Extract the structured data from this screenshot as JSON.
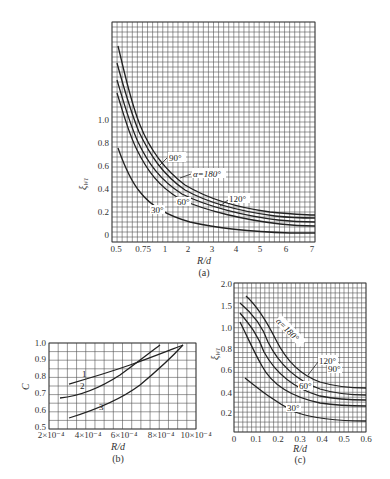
{
  "chart_data": [
    {
      "id": "a",
      "type": "line",
      "caption": "(a)",
      "xlabel": "R/d",
      "ylabel": "ξW1",
      "x_ticks": [
        "0.5",
        "0.75",
        "1",
        "2",
        "3",
        "4",
        "5",
        "6",
        "7"
      ],
      "y_ticks": [
        "0",
        "0.2",
        "0.4",
        "0.6",
        "0.8",
        "1.0"
      ],
      "ylim": [
        0,
        1.85
      ],
      "grid": true,
      "series": [
        {
          "name": "α=180°",
          "x": [
            0.55,
            0.75,
            1,
            2,
            3,
            4,
            5,
            6,
            7
          ],
          "values": [
            1.5,
            1.05,
            0.72,
            0.46,
            0.36,
            0.31,
            0.29,
            0.27,
            0.26
          ]
        },
        {
          "name": "120°",
          "x": [
            0.55,
            0.75,
            1,
            2,
            3,
            4,
            5,
            6,
            7
          ],
          "values": [
            1.33,
            0.92,
            0.62,
            0.39,
            0.3,
            0.26,
            0.24,
            0.22,
            0.21
          ]
        },
        {
          "name": "90°",
          "x": [
            0.55,
            0.75,
            1,
            2,
            3,
            4,
            5,
            6,
            7
          ],
          "values": [
            1.76,
            1.15,
            0.8,
            0.52,
            0.4,
            0.35,
            0.32,
            0.3,
            0.29
          ]
        },
        {
          "name": "60°",
          "x": [
            0.55,
            0.75,
            1,
            2,
            3,
            4,
            5,
            6,
            7
          ],
          "values": [
            1.24,
            0.84,
            0.55,
            0.33,
            0.25,
            0.21,
            0.19,
            0.18,
            0.17
          ]
        },
        {
          "name": "30°",
          "x": [
            0.55,
            0.75,
            1,
            2,
            3,
            4,
            5,
            6,
            7
          ],
          "values": [
            0.77,
            0.5,
            0.32,
            0.18,
            0.13,
            0.1,
            0.09,
            0.08,
            0.08
          ]
        }
      ],
      "annotations": [
        "90°",
        "α=180°",
        "120°",
        "60°",
        "30°"
      ]
    },
    {
      "id": "b",
      "type": "line",
      "caption": "(b)",
      "xlabel": "R/d",
      "ylabel": "C",
      "x_ticks": [
        "2×10⁻⁴",
        "4×10⁻⁴",
        "6×10⁻⁴",
        "8×10⁻⁴",
        "10×10⁻⁴"
      ],
      "y_ticks": [
        "0.5",
        "0.6",
        "0.7",
        "0.8",
        "0.9",
        "1.0"
      ],
      "xlim": [
        0.0002,
        0.001
      ],
      "ylim": [
        0.5,
        1.0
      ],
      "grid": true,
      "series": [
        {
          "name": "1",
          "x": [
            0.00025,
            0.0004,
            0.0006,
            0.0008,
            0.00095
          ],
          "values": [
            0.78,
            0.84,
            0.9,
            0.95,
            1.0
          ]
        },
        {
          "name": "2",
          "x": [
            0.00025,
            0.0004,
            0.0006,
            0.0007,
            0.00084
          ],
          "values": [
            0.7,
            0.77,
            0.88,
            0.93,
            1.0
          ]
        },
        {
          "name": "3",
          "x": [
            0.00025,
            0.0004,
            0.0006,
            0.0008,
            0.00095
          ],
          "values": [
            0.56,
            0.62,
            0.71,
            0.86,
            1.0
          ]
        }
      ],
      "annotations": [
        "1",
        "2",
        "3"
      ]
    },
    {
      "id": "c",
      "type": "line",
      "caption": "(c)",
      "xlabel": "R/d",
      "ylabel": "ξW1",
      "x_ticks": [
        "0",
        "0.1",
        "0.2",
        "0.3",
        "0.4",
        "0.5",
        "0.6"
      ],
      "y_ticks": [
        "0.2",
        "0.4",
        "0.6",
        "0.8",
        "1.0",
        "1.5",
        "2.0"
      ],
      "xlim": [
        0,
        0.6
      ],
      "grid": true,
      "series": [
        {
          "name": "α=180°",
          "x": [
            0.07,
            0.1,
            0.2,
            0.3,
            0.4,
            0.5,
            0.6
          ],
          "values": [
            1.7,
            1.5,
            0.95,
            0.68,
            0.55,
            0.47,
            0.47
          ]
        },
        {
          "name": "120°",
          "x": [
            0.05,
            0.1,
            0.2,
            0.3,
            0.4,
            0.5,
            0.6
          ],
          "values": [
            1.55,
            1.3,
            0.78,
            0.56,
            0.44,
            0.38,
            0.38
          ]
        },
        {
          "name": "90°",
          "x": [
            0.05,
            0.1,
            0.2,
            0.3,
            0.4,
            0.5,
            0.6
          ],
          "values": [
            1.35,
            1.1,
            0.68,
            0.48,
            0.38,
            0.34,
            0.34
          ]
        },
        {
          "name": "60°",
          "x": [
            0.05,
            0.1,
            0.2,
            0.3,
            0.4,
            0.5,
            0.6
          ],
          "values": [
            1.1,
            0.85,
            0.55,
            0.4,
            0.31,
            0.27,
            0.27
          ]
        },
        {
          "name": "30°",
          "x": [
            0.07,
            0.1,
            0.2,
            0.3,
            0.4,
            0.5,
            0.6
          ],
          "values": [
            0.5,
            0.43,
            0.27,
            0.18,
            0.15,
            0.13,
            0.13
          ]
        }
      ],
      "annotations": [
        "α=180°",
        "120°",
        "90°",
        "60°",
        "30°"
      ]
    }
  ],
  "labels": {
    "a": {
      "caption": "(a)",
      "xlabel": "R/d",
      "ylabel": "ξ",
      "ylabel_sub": "W1",
      "ann_90": "90°",
      "ann_180": "α=180°",
      "ann_120": "120°",
      "ann_60": "60°",
      "ann_30": "30°",
      "xt": [
        "0.5",
        "0.75",
        "1",
        "2",
        "3",
        "4",
        "5",
        "6",
        "7"
      ],
      "yt": [
        "0",
        "0.2",
        "0.4",
        "0.6",
        "0.8",
        "1.0"
      ]
    },
    "b": {
      "caption": "(b)",
      "xlabel": "R/d",
      "ylabel": "C",
      "ann_1": "1",
      "ann_2": "2",
      "ann_3": "3",
      "xt": [
        "2×10⁻⁴",
        "4×10⁻⁴",
        "6×10⁻⁴",
        "8×10⁻⁴",
        "10×10⁻⁴"
      ],
      "yt": [
        "0.5",
        "0.6",
        "0.7",
        "0.8",
        "0.9",
        "1.0"
      ]
    },
    "c": {
      "caption": "(c)",
      "xlabel": "R/d",
      "ylabel": "ξ",
      "ylabel_sub": "W1",
      "ann_180": "α=180°",
      "ann_120": "120°",
      "ann_90": "90°",
      "ann_60": "60°",
      "ann_30": "30°",
      "xt": [
        "0",
        "0.1",
        "0.2",
        "0.3",
        "0.4",
        "0.5",
        "0.6"
      ],
      "yt": [
        "0.2",
        "0.4",
        "0.6",
        "0.8",
        "1.0",
        "1.5",
        "2.0"
      ]
    }
  }
}
